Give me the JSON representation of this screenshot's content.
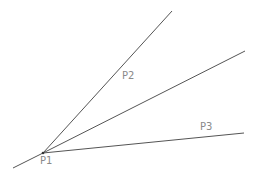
{
  "diagram": {
    "type": "angle-construction",
    "line_color": "#555555",
    "label_color": "#8a8a8a",
    "vertex": {
      "name": "P1",
      "x": 43,
      "y": 153
    },
    "lines": [
      {
        "id": "ray-upper",
        "from": [
          43,
          153
        ],
        "to": [
          172,
          11
        ]
      },
      {
        "id": "ray-bisector",
        "from": [
          43,
          153
        ],
        "to": [
          245,
          51
        ]
      },
      {
        "id": "ray-lower",
        "from": [
          43,
          153
        ],
        "to": [
          244,
          133
        ]
      },
      {
        "id": "extension",
        "from": [
          43,
          153
        ],
        "to": [
          13,
          168
        ]
      }
    ],
    "labels": {
      "p1": {
        "text": "P1",
        "x": 40,
        "y": 164
      },
      "p2": {
        "text": "P2",
        "x": 122,
        "y": 79
      },
      "p3": {
        "text": "P3",
        "x": 200,
        "y": 130
      }
    }
  }
}
